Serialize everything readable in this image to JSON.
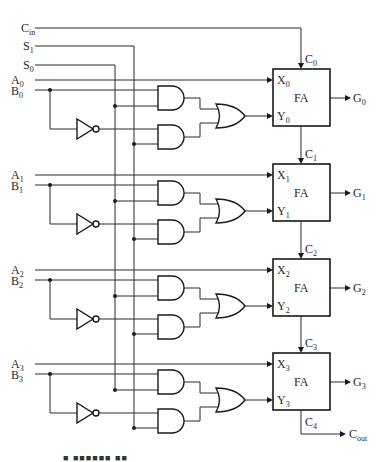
{
  "diagram": {
    "type": "4-bit arithmetic circuit (full adders with B input selection logic)",
    "inputs": {
      "cin": {
        "base": "C",
        "sub": "in"
      },
      "s1": {
        "base": "S",
        "sub": "1"
      },
      "s0": {
        "base": "S",
        "sub": "0"
      }
    },
    "stages": [
      {
        "a": {
          "base": "A",
          "sub": "0"
        },
        "b": {
          "base": "B",
          "sub": "0"
        },
        "x": {
          "base": "X",
          "sub": "0"
        },
        "y": {
          "base": "Y",
          "sub": "0"
        },
        "cin": {
          "base": "C",
          "sub": "0"
        },
        "g": {
          "base": "G",
          "sub": "0"
        },
        "fa": "FA"
      },
      {
        "a": {
          "base": "A",
          "sub": "1"
        },
        "b": {
          "base": "B",
          "sub": "1"
        },
        "x": {
          "base": "X",
          "sub": "1"
        },
        "y": {
          "base": "Y",
          "sub": "1"
        },
        "cin": {
          "base": "C",
          "sub": "1"
        },
        "g": {
          "base": "G",
          "sub": "1"
        },
        "fa": "FA"
      },
      {
        "a": {
          "base": "A",
          "sub": "2"
        },
        "b": {
          "base": "B",
          "sub": "2"
        },
        "x": {
          "base": "X",
          "sub": "2"
        },
        "y": {
          "base": "Y",
          "sub": "2"
        },
        "cin": {
          "base": "C",
          "sub": "2"
        },
        "g": {
          "base": "G",
          "sub": "2"
        },
        "fa": "FA"
      },
      {
        "a": {
          "base": "A",
          "sub": "3"
        },
        "b": {
          "base": "B",
          "sub": "3"
        },
        "x": {
          "base": "X",
          "sub": "3"
        },
        "y": {
          "base": "Y",
          "sub": "3"
        },
        "cin": {
          "base": "C",
          "sub": "3"
        },
        "g": {
          "base": "G",
          "sub": "3"
        },
        "fa": "FA"
      }
    ],
    "outputs": {
      "c4": {
        "base": "C",
        "sub": "4"
      },
      "cout": {
        "base": "C",
        "sub": "out"
      }
    },
    "caption": "■ ■■■■■■ ■■"
  }
}
